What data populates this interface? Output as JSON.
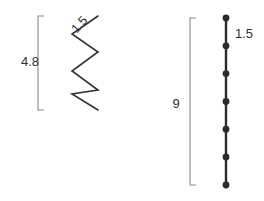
{
  "figure": {
    "background_color": "#ffffff",
    "width": 264,
    "height": 201
  },
  "left_figure": {
    "name": "zigzag-figure",
    "bracket": {
      "label": "4.8",
      "orientation": "vertical-left",
      "color": "#8a8a8a",
      "x": 38,
      "y_top": 16,
      "y_bottom": 110,
      "tick_length": 6
    },
    "segment_label": {
      "label": "1.5",
      "rotation_deg": -48,
      "color": "#2f2f2f"
    },
    "zigzag": {
      "color": "#333333",
      "stroke_width": 1.6,
      "segment_count": 5,
      "left_x": 72,
      "right_x": 98,
      "points": "98,16 72,34 98,52 72,71 98,90 72,94 98,110"
    }
  },
  "right_figure": {
    "name": "bead-chain-figure",
    "bracket": {
      "label": "9",
      "orientation": "vertical-left",
      "color": "#8a8a8a",
      "x": 190,
      "y_top": 18,
      "y_bottom": 185,
      "tick_length": 6
    },
    "segment_label": {
      "label": "1.5",
      "rotation_deg": 0,
      "color": "#2f2f2f"
    },
    "chain": {
      "color": "#2b2b2b",
      "stroke_width": 2.4,
      "x": 226,
      "y_top": 18,
      "y_bottom": 185,
      "dot_radius": 3.4,
      "dot_count": 7,
      "dot_y_positions": [
        18,
        45.8,
        73.6,
        101.4,
        129.2,
        157.0,
        185
      ]
    }
  },
  "labels": {
    "left_bracket_value": "4.8",
    "left_segment_value": "1.5",
    "right_bracket_value": "9",
    "right_segment_value": "1.5"
  }
}
